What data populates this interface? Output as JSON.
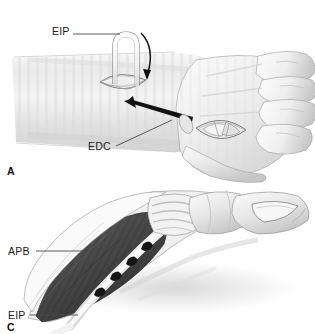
{
  "figure": {
    "background_color": "#ffffff",
    "width": 315,
    "height": 334
  },
  "panels": [
    {
      "id": "A",
      "label": "A",
      "caption": "Dorsal forearm and hand: EIP tendon harvested and rerouted",
      "labels": [
        {
          "key": "eip_top",
          "text": "EIP",
          "x": 52,
          "y": 30,
          "leader": "horizontal-right"
        },
        {
          "key": "edc_mid",
          "text": "EDC",
          "x": 90,
          "y": 146,
          "leader": "diagonal-up-right"
        }
      ]
    },
    {
      "id": "C",
      "label": "C",
      "caption": "Thumb: EIP tendon woven and sutured into APB muscle",
      "labels": [
        {
          "key": "apb",
          "text": "APB",
          "x": 8,
          "y": 246,
          "leader": "horizontal-right"
        },
        {
          "key": "eip_bot",
          "text": "EIP",
          "x": 8,
          "y": 310,
          "leader": "horizontal-right"
        }
      ]
    }
  ],
  "annotations": {
    "eip_label": "EIP",
    "edc_label": "EDC",
    "apb_label": "APB",
    "eip_lower_label": "EIP",
    "panel_a_label": "A",
    "panel_c_label": "C"
  },
  "arrows": [
    {
      "name": "curved-arrow-eip-loop",
      "description": "curved arrow over EIP tendon loop, pointing down into proximal incision"
    },
    {
      "name": "transfer-arrow",
      "description": "tapered straight arrow pointing up-left from distal incision toward proximal incision, indicating tendon transfer direction"
    }
  ],
  "colors": {
    "skin_light": "#f4f4f4",
    "skin_mid": "#e3e3e3",
    "skin_shadow": "#c9c9c9",
    "outline": "#6e6e6e",
    "outline_dark": "#3d3d3d",
    "muscle_dark": "#4a4a4a",
    "muscle_mid": "#6b6b6b",
    "tendon_white": "#fbfbfb",
    "suture_black": "#1a1a1a",
    "label_text": "#1b1b1b",
    "leader_line": "#4a4a4a"
  }
}
